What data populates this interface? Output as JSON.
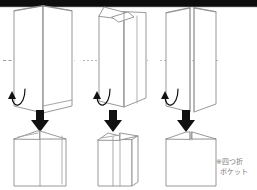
{
  "page": {
    "background_color": "#ffffff",
    "line_color": "#8a8a8a",
    "arrow_color": "#111111",
    "top_bar_color": "#0d0d0d",
    "note_color": "#7b7b7b"
  },
  "annotation": {
    "line1": "※四つ折",
    "line2": "ポケット"
  },
  "steps": [
    {
      "id": "step-1",
      "top_label": "open-folded-sheet-front-view",
      "bottom_label": "folded-pocket-result",
      "has_extra_flap": false,
      "fold_line": "dashed-horizontal"
    },
    {
      "id": "step-2",
      "top_label": "open-folded-sheet-with-flap",
      "bottom_label": "folded-pocket-result-narrow",
      "has_extra_flap": true,
      "fold_line": "dashed-horizontal"
    },
    {
      "id": "step-3",
      "top_label": "open-folded-sheet-closed",
      "bottom_label": "folded-pocket-result-wide",
      "has_extra_flap": false,
      "fold_line": "dashed-horizontal"
    }
  ],
  "symbols": {
    "curl_arrow": "fold-up-curved-arrow",
    "down_arrow": "result-down-arrow",
    "fold_guide": "dashed-fold-line"
  }
}
